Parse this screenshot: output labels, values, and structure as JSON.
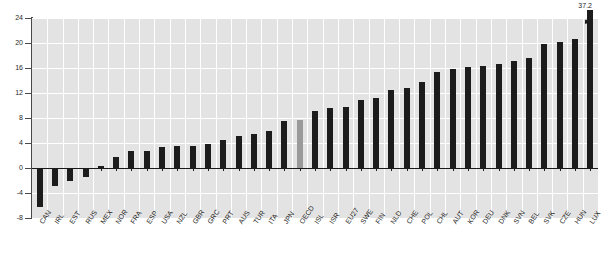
{
  "chart_data": {
    "type": "bar",
    "title": "",
    "subtitle": "",
    "xlabel": "",
    "ylabel": "",
    "ylim": [
      -8,
      24
    ],
    "yticks": [
      -8,
      -4,
      0,
      4,
      8,
      12,
      16,
      20,
      24
    ],
    "ytick_labels": [
      "-8",
      "-4",
      "0",
      "4",
      "8",
      "12",
      "16",
      "20",
      "24"
    ],
    "grid": true,
    "legend": "none",
    "bar_color": "#1c1c1c",
    "highlight_color": "#9a9a9a",
    "plot_bg": "#e3e3e3",
    "highlight_category": "OECD",
    "categories": [
      "CAN",
      "IRL",
      "EST",
      "RUS",
      "MEX",
      "NOR",
      "FRA",
      "ESP",
      "USA",
      "NZL",
      "GBR",
      "GRC",
      "PRT",
      "AUS",
      "TUR",
      "ITA",
      "JPN",
      "OECD",
      "ISL",
      "ISR",
      "EU27",
      "SWE",
      "FIN",
      "NLD",
      "CHE",
      "POL",
      "CHL",
      "AUT",
      "KOR",
      "DEU",
      "DNK",
      "SVN",
      "BEL",
      "SVK",
      "CZE",
      "HUN",
      "LUX"
    ],
    "values": [
      -6.2,
      -2.8,
      -2.0,
      -1.5,
      0.3,
      1.7,
      2.7,
      2.7,
      3.4,
      3.5,
      3.5,
      3.9,
      4.5,
      5.1,
      5.5,
      6.0,
      7.6,
      7.7,
      9.2,
      9.6,
      9.7,
      10.9,
      11.2,
      12.5,
      12.8,
      13.7,
      15.4,
      15.9,
      16.1,
      16.3,
      16.7,
      17.2,
      17.6,
      19.8,
      20.2,
      20.7,
      37.2
    ],
    "annotations": [
      {
        "category": "LUX",
        "text": "37.2",
        "value": 37.2,
        "clipped": true
      }
    ]
  }
}
